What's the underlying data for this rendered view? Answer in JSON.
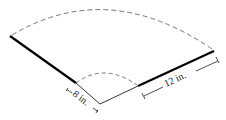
{
  "diagram": {
    "type": "annular-sector (fan/lampshade net)",
    "labels": {
      "inner_radius": "8 in.",
      "slant_width": "12 in."
    },
    "colors": {
      "stroke": "#000000",
      "dashed": "#555555",
      "background": "#ffffff"
    }
  }
}
